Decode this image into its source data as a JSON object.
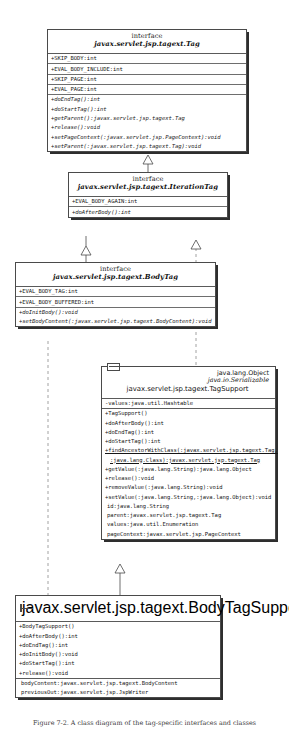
{
  "diagram": {
    "caption": "Figure 7-2. A class diagram of the tag-specific interfaces and classes",
    "colors": {
      "line": "#4a4a4a",
      "text": "#161616",
      "background": "#ffffff"
    }
  },
  "classes": {
    "tag": {
      "stereotype": "interface",
      "name": "javax.servlet.jsp.tagext.Tag",
      "attributes": [
        "+SKIP_BODY:int",
        "+EVAL_BODY_INCLUDE:int",
        "+SKIP_PAGE:int",
        "+EVAL_PAGE:int"
      ],
      "operations": [
        "+doEndTag():int",
        "+doStartTag():int",
        "+getParent():javax.servlet.jsp.tagext.Tag",
        "+release():void",
        "+setPageContext(:javax.servlet.jsp.PageContext):void",
        "+setParent(:javax.servlet.jsp.tagext.Tag):void"
      ]
    },
    "iteration_tag": {
      "stereotype": "interface",
      "name": "javax.servlet.jsp.tagext.IterationTag",
      "attributes": [
        "+EVAL_BODY_AGAIN:int"
      ],
      "operations": [
        "+doAfterBody():int"
      ]
    },
    "body_tag": {
      "stereotype": "interface",
      "name": "javax.servlet.jsp.tagext.BodyTag",
      "attributes": [
        "+EVAL_BODY_TAG:int",
        "+EVAL_BODY_BUFFERED:int"
      ],
      "operations": [
        "+doInitBody():void",
        "+setBodyContent(:javax.servlet.jsp.tagext.BodyContent):void"
      ]
    },
    "tag_support": {
      "supertypes": [
        "java.lang.Object",
        "java.io.Serializable"
      ],
      "name": "javax.servlet.jsp.tagext.TagSupport",
      "attributes": [
        "-values:java.util.Hashtable"
      ],
      "operations": [
        "+TagSupport()",
        "+doAfterBody():int",
        "+doEndTag():int",
        "+doStartTag():int",
        "+findAncestorWithClass(:javax.servlet.jsp.tagext.Tag,",
        ":java.lang.Class):javax.servlet.jsp.tagext.Tag",
        "+getValue(:java.lang.String):java.lang.Object",
        "+release():void",
        "+removeValue(:java.lang.String):void",
        "+setValue(:java.lang.String,:java.lang.Object):void"
      ],
      "fields": [
        "id:java.lang.String",
        "parent:javax.servlet.jsp.tagext.Tag",
        "values:java.util.Enumeration",
        "pageContext:javax.servlet.jsp.PageContext"
      ]
    },
    "body_tag_support": {
      "name": "javax.servlet.jsp.tagext.BodyTagSupport",
      "operations": [
        "+BodyTagSupport()",
        "+doAfterBody():int",
        "+doEndTag():int",
        "+doInitBody():void",
        "+doStartTag():int",
        "+release():void"
      ],
      "fields": [
        "bodyContent:javax.servlet.jsp.tagext.BodyContent",
        "previousOut:javax.servlet.jsp.JspWriter"
      ]
    }
  }
}
